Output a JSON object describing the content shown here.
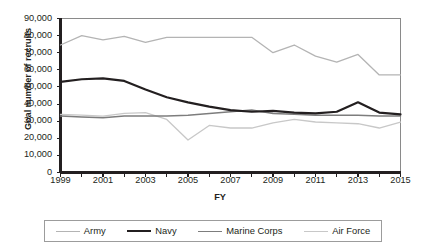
{
  "chart_data": {
    "type": "line",
    "title": "",
    "xlabel": "FY",
    "ylabel": "Goal number of recruits",
    "xlim": [
      1999,
      2015
    ],
    "ylim": [
      0,
      90000
    ],
    "ytick_step": 10000,
    "xtick_step": 1,
    "grid": false,
    "legend_position": "bottom",
    "x": [
      1999,
      2000,
      2001,
      2002,
      2003,
      2004,
      2005,
      2006,
      2007,
      2008,
      2009,
      2010,
      2011,
      2012,
      2013,
      2014,
      2015
    ],
    "xtick_labels": [
      "1999",
      "",
      "2001",
      "",
      "2003",
      "",
      "2005",
      "",
      "2007",
      "",
      "2009",
      "",
      "2011",
      "",
      "2013",
      "",
      "2015"
    ],
    "ytick_labels": [
      "0",
      "10,000",
      "20,000",
      "30,000",
      "40,000",
      "50,000",
      "60,000",
      "70,000",
      "80,000",
      "90,000"
    ],
    "ytick_values": [
      0,
      10000,
      20000,
      30000,
      40000,
      50000,
      60000,
      70000,
      80000,
      90000
    ],
    "series": [
      {
        "name": "Army",
        "color": "#b4b4b4",
        "width": 1.3,
        "values": [
          74500,
          80000,
          77500,
          79500,
          76000,
          79000,
          79000,
          79000,
          79000,
          79000,
          70000,
          74500,
          68000,
          64500,
          69000,
          57000,
          57000
        ]
      },
      {
        "name": "Navy",
        "color": "#231f20",
        "width": 2.2,
        "values": [
          53000,
          54500,
          55000,
          53500,
          48500,
          44000,
          41000,
          38500,
          36500,
          35500,
          36000,
          35000,
          34500,
          35500,
          41000,
          35000,
          34000
        ]
      },
      {
        "name": "Marine Corps",
        "color": "#7d7d7d",
        "width": 1.5,
        "values": [
          33000,
          32500,
          32000,
          33000,
          33000,
          33000,
          33500,
          34500,
          35500,
          36500,
          34500,
          34000,
          33500,
          33500,
          33500,
          33000,
          33000
        ]
      },
      {
        "name": "Air Force",
        "color": "#c8c8c8",
        "width": 1.3,
        "values": [
          34000,
          33500,
          33000,
          34500,
          35000,
          31000,
          19000,
          27500,
          26000,
          26000,
          29000,
          31000,
          29500,
          29000,
          28500,
          26000,
          29500
        ]
      }
    ]
  },
  "axis": {
    "y_title": "Goal number of recruits",
    "x_title": "FY"
  },
  "legend": {
    "items": [
      {
        "label": "Army",
        "color": "#b4b4b4",
        "thickness": "1.5px"
      },
      {
        "label": "Navy",
        "color": "#231f20",
        "thickness": "2.6px"
      },
      {
        "label": "Marine Corps",
        "color": "#7d7d7d",
        "thickness": "1.8px"
      },
      {
        "label": "Air Force",
        "color": "#c8c8c8",
        "thickness": "1.5px"
      }
    ]
  }
}
